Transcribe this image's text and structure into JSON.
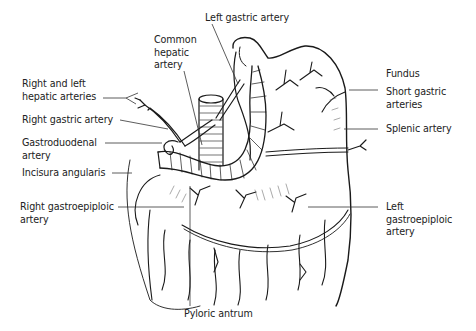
{
  "figure": {
    "ink_color": "#1a1a1a",
    "background": "#ffffff"
  },
  "labels": {
    "left_gastric_artery": "Left gastric artery",
    "common_hepatic_artery": "Common\nhepatic\nartery",
    "right_left_hepatic_arteries": "Right and left\nhepatic arteries",
    "right_gastric_artery": "Right gastric artery",
    "gastroduodenal_artery": "Gastroduodenal\nartery",
    "incisura_angularis": "Incisura angularis",
    "right_gastroepiploic_artery": "Right gastroepiploic\nartery",
    "fundus": "Fundus",
    "short_gastric_arteries": "Short gastric\narteries",
    "splenic_artery": "Splenic artery",
    "left_gastroepiploic_artery": "Left\ngastroepiploic\nartery",
    "pyloric_antrum": "Pyloric antrum"
  }
}
